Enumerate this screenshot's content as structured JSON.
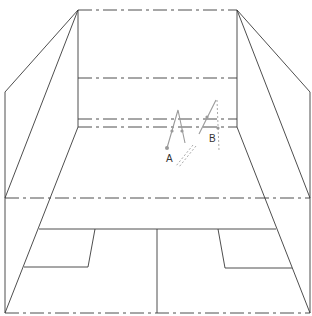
{
  "diagram": {
    "title": "",
    "labels": {
      "figure_a": "A",
      "figure_b": "B"
    },
    "colors": {
      "line": "#3a3a3a",
      "figure": "#9a9a9a",
      "background": "#ffffff"
    }
  }
}
